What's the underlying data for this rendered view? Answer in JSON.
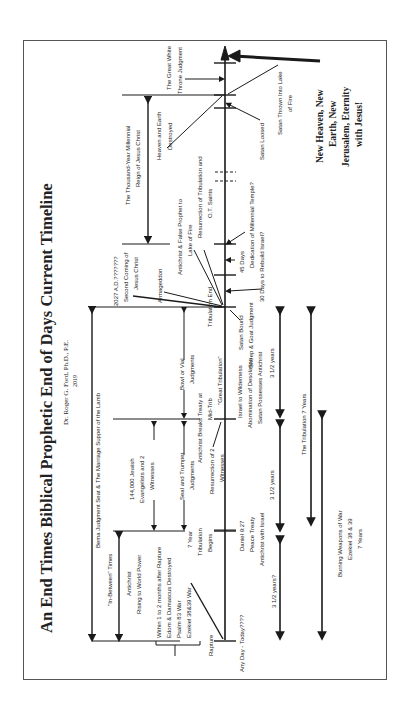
{
  "header": {
    "title": "An End Times Biblical Prophetic End of Days Current Timeline",
    "author": "Dr. Roger G. Ford, Ph.D., P.E.",
    "year": "2019"
  },
  "eternity": {
    "line1": "New Heaven, New",
    "line2": "Earth, New",
    "line3": "Jerusalem, Eternity",
    "line4": "with Jesus!"
  },
  "labels": {
    "thousand_year_1": "The Thousand-Year Millennial",
    "thousand_year_2": "Reign of Jesus Christ",
    "great_white_1": "The Great White",
    "great_white_2": "Throne Judgment",
    "heaven_earth_1": "Heaven and Earth",
    "heaven_earth_2": "Destroyed",
    "satan_loosed": "Satan Loosed",
    "satan_thrown_1": "Satan Thrown Into Lake",
    "satan_thrown_2": "of Fire",
    "antichrist_false_1": "Antichrist & False Prophet to",
    "antichrist_false_2": "Lake of Fire",
    "resurrection_ot_1": "Resurrection of Tribulation and",
    "resurrection_ot_2": "O.T. Saints",
    "dedication_1": "45 Days",
    "dedication_2": "Dedication of Millennial Temple?",
    "rebuild": "30 Days to Rebuild Israel?",
    "second_coming_1": "2027 A.D.???????",
    "second_coming_2": "Second Coming of",
    "second_coming_3": "Jesus Christ",
    "armageddon": "Armageddon",
    "trib_end": "Tribulation End",
    "satan_bound": "Satan Bound",
    "sheep_goat": "Sheep & Goat Judgment",
    "bema": "Bema Judgment Seat & The Marriage Supper of the Lamb",
    "witnesses_144_1": "144,000 Jewish",
    "witnesses_144_2": "Evangelists and 2",
    "witnesses_144_3": "Witnesses",
    "bowl_1": "Bowl or Vial",
    "bowl_2": "Judgments",
    "seal_1": "Seal and Trumpet",
    "seal_2": "Judgments",
    "breaks_treaty": "Antichrist Breaks Treaty at",
    "mid_trib": "Mid-Trib",
    "res_two_1": "Resurrection of 2",
    "res_two_2": "Witnesses",
    "great_trib": "\"Great Tribulation\"",
    "israel_wild": "Israel to Wilderness",
    "abomination": "Abomination of Desolation",
    "satan_possesses": "Satan Possesses Antichrist",
    "in_between": "\"In-Between\" Times",
    "antichrist_rising_1": "Antichrist",
    "antichrist_rising_2": "Rising to World Power",
    "within_1": "Within 1 to 2 months after Rapture",
    "within_2": "Edom & Damascus Destroyed",
    "within_3": "Psalm 83 War",
    "within_4": "Ezekiel 38&39 War",
    "seven_year_1": "7 Year",
    "seven_year_2": "Tribulation",
    "seven_year_3": "Begins",
    "daniel_1": "Daniel 9:27",
    "daniel_2": "Peace Treaty",
    "daniel_3": "Antichrist with Israel",
    "rapture": "Rapture",
    "any_day": "Any Day - Today????",
    "half_a": "3 1/2 years?",
    "half_b": "3 1/2 years",
    "half_c": "3 1/2 years",
    "tribulation_7": "The Tribulation 7 Years",
    "burning_1": "Burning Weapons of War",
    "burning_2": "Ezekiel 38 & 39",
    "burning_3": "7 Years"
  },
  "colors": {
    "ink": "#1a1a1a",
    "frame": "#555555",
    "background": "#ffffff"
  }
}
